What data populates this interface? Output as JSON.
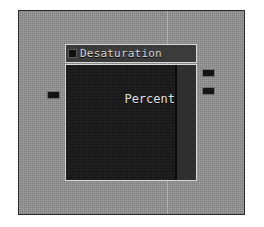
{
  "app": {
    "view_name": "Node Graph Editor",
    "canvas_background": "#8e8e8e",
    "canvas_border_color": "#2a2a2a"
  },
  "node": {
    "title": "Desaturation",
    "header_icon": "node-collapse-icon",
    "header_color": "#3b3b3b",
    "body_color": "#1b1b1b",
    "border_color": "#d8d8d8",
    "fields": [
      {
        "label": "Percent"
      }
    ],
    "inputs": [
      {
        "name": "input-socket",
        "icon": "socket-icon"
      }
    ],
    "outputs": [
      {
        "name": "output-socket-primary",
        "icon": "socket-icon"
      },
      {
        "name": "output-socket-secondary",
        "icon": "socket-icon"
      }
    ]
  }
}
